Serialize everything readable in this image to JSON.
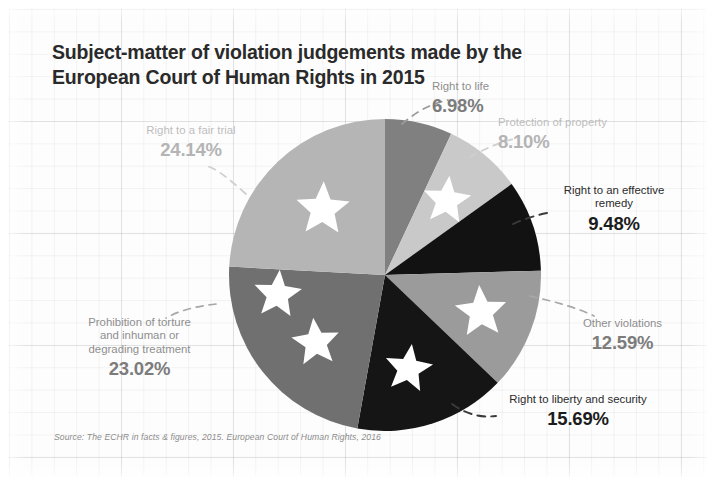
{
  "title": {
    "line1": "Subject-matter of violation judgements made by the",
    "line2": "European Court of Human Rights in 2015"
  },
  "source": "Source: The ECHR in facts & figures, 2015. European Court of Human Rights, 2016",
  "labels": {
    "fair_trial": {
      "name": "Right to a fair trial",
      "pct": "24.14%"
    },
    "life": {
      "name": "Right to life",
      "pct": "6.98%"
    },
    "property": {
      "name": "Protection of property",
      "pct": "8.10%"
    },
    "remedy": {
      "name": "Right to an effective\nremedy",
      "pct": "9.48%"
    },
    "other": {
      "name": "Other violations",
      "pct": "12.59%"
    },
    "liberty": {
      "name": "Right to liberty and security",
      "pct": "15.69%"
    },
    "torture": {
      "name": "Prohibition of torture\nand inhuman or\ndegrading treatment",
      "pct": "23.02%"
    }
  },
  "chart_data": {
    "type": "pie",
    "title": "Subject-matter of violation judgements made by the European Court of Human Rights in 2015",
    "subtitle": "",
    "xlabel": "",
    "ylabel": "",
    "legend_position": "callout-labels",
    "grid": true,
    "units": "percent",
    "total": 100.0,
    "start_angle_deg": 0,
    "direction": "clockwise",
    "categories": [
      "Right to life",
      "Protection of property",
      "Right to an effective remedy",
      "Other violations",
      "Right to liberty and security",
      "Prohibition of torture and inhuman or degrading treatment",
      "Right to a fair trial"
    ],
    "values": [
      6.98,
      8.1,
      9.48,
      12.59,
      15.69,
      23.02,
      24.14
    ],
    "slices": [
      {
        "label": "Right to life",
        "value": 6.98,
        "display": "6.98%",
        "color": "#808080"
      },
      {
        "label": "Protection of property",
        "value": 8.1,
        "display": "8.10%",
        "color": "#c9c9c9"
      },
      {
        "label": "Right to an effective remedy",
        "value": 9.48,
        "display": "9.48%",
        "color": "#121212"
      },
      {
        "label": "Other violations",
        "value": 12.59,
        "display": "12.59%",
        "color": "#9b9b9b"
      },
      {
        "label": "Right to liberty and security",
        "value": 15.69,
        "display": "15.69%",
        "color": "#151515"
      },
      {
        "label": "Prohibition of torture and inhuman or degrading treatment",
        "value": 23.02,
        "display": "23.02%",
        "color": "#707070"
      },
      {
        "label": "Right to a fair trial",
        "value": 24.14,
        "display": "24.14%",
        "color": "#b5b5b5"
      }
    ],
    "annotations": [
      "white five-pointed stars overlaid on slices (EU flag motif)"
    ],
    "source": "Source: The ECHR in facts & figures, 2015. European Court of Human Rights, 2016"
  },
  "colors": {
    "background": "#fdfdfd",
    "title_text": "#2a2a2a",
    "dark_label": "#1c1c1c",
    "mid_label": "#8e8e8e",
    "light_label": "#b8b8b8",
    "leader_line": "#6f6f6f",
    "star": "#ffffff"
  }
}
